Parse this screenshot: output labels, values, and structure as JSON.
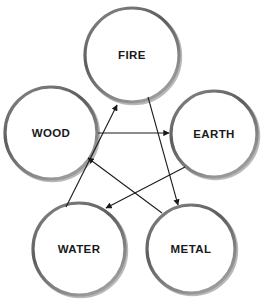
{
  "diagram": {
    "background_color": "#ffffff",
    "circle_stroke_color": "#6e6e6e",
    "circle_fill_color": "#ffffff",
    "arrow_color": "#1a1a1a",
    "label_color": "#1a1a1a",
    "nodes": [
      {
        "id": "fire",
        "label": "FIRE",
        "cx": 132,
        "cy": 55,
        "r": 47
      },
      {
        "id": "wood",
        "label": "WOOD",
        "cx": 51,
        "cy": 133,
        "r": 46
      },
      {
        "id": "earth",
        "label": "EARTH",
        "cx": 214,
        "cy": 134,
        "r": 43
      },
      {
        "id": "water",
        "label": "WATER",
        "cx": 79,
        "cy": 249,
        "r": 46
      },
      {
        "id": "metal",
        "label": "METAL",
        "cx": 191,
        "cy": 249,
        "r": 44
      }
    ],
    "arrows": [
      {
        "id": "wood-to-earth",
        "from": "wood",
        "to": "earth",
        "x1": 98,
        "y1": 133,
        "x2": 169,
        "y2": 133
      },
      {
        "id": "water-to-fire",
        "from": "water",
        "to": "fire",
        "x1": 66,
        "y1": 207,
        "x2": 117,
        "y2": 105
      },
      {
        "id": "fire-to-metal",
        "from": "fire",
        "to": "metal",
        "x1": 148,
        "y1": 97,
        "x2": 178,
        "y2": 205
      },
      {
        "id": "metal-to-wood",
        "from": "metal",
        "to": "wood",
        "x1": 162,
        "y1": 213,
        "x2": 88,
        "y2": 158
      },
      {
        "id": "earth-to-water",
        "from": "earth",
        "to": "water",
        "x1": 185,
        "y1": 167,
        "x2": 106,
        "y2": 208
      }
    ]
  }
}
